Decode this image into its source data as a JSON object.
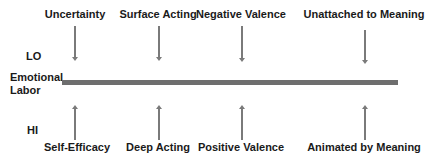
{
  "diagram": {
    "axis_label_line1": "Emotional",
    "axis_label_line2": "Labor",
    "lo_label": "LO",
    "hi_label": "HI",
    "top_factors": [
      {
        "label": "Uncertainty"
      },
      {
        "label": "Surface Acting"
      },
      {
        "label": "Negative Valence"
      },
      {
        "label": "Unattached to Meaning"
      }
    ],
    "bottom_factors": [
      {
        "label": "Self-Efficacy"
      },
      {
        "label": "Deep Acting"
      },
      {
        "label": "Positive Valence"
      },
      {
        "label": "Animated by Meaning"
      }
    ],
    "colors": {
      "bar": "#6e6e6e",
      "arrow": "#7a7a7a",
      "text": "#1a1a1a"
    }
  }
}
